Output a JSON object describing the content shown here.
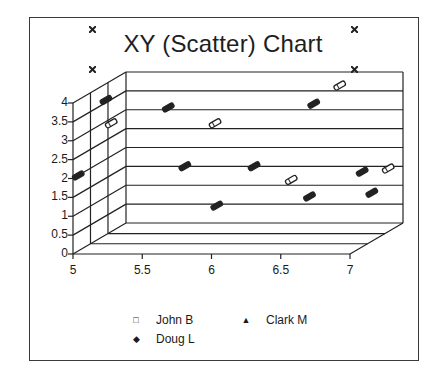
{
  "chart_data": {
    "type": "scatter",
    "title": "XY (Scatter) Chart",
    "xlabel": "",
    "ylabel": "",
    "xlim": [
      5,
      7
    ],
    "ylim": [
      0,
      4
    ],
    "x_ticks": [
      "5",
      "5.5",
      "6",
      "6.5",
      "7"
    ],
    "y_ticks": [
      "0",
      "0.5",
      "1",
      "1.5",
      "2",
      "2.5",
      "3",
      "3.5",
      "4"
    ],
    "grid": true,
    "three_d": true,
    "legend_position": "bottom",
    "series": [
      {
        "name": "John B",
        "marker": "square",
        "points": [
          [
            5.2,
            3.3
          ],
          [
            5.95,
            3.3
          ],
          [
            6.5,
            1.8
          ],
          [
            6.85,
            4.3
          ],
          [
            7.2,
            2.1
          ]
        ]
      },
      {
        "name": "Clark M",
        "marker": "triangle",
        "points": [
          [
            5.75,
            2.2
          ],
          [
            6.25,
            2.2
          ],
          [
            6.65,
            1.4
          ],
          [
            7.1,
            1.5
          ]
        ]
      },
      {
        "name": "Doug L",
        "marker": "diamond",
        "points": [
          [
            5.0,
            2.0
          ],
          [
            5.2,
            4.0
          ],
          [
            5.65,
            3.8
          ],
          [
            6.0,
            1.2
          ],
          [
            6.7,
            3.9
          ],
          [
            7.05,
            2.1
          ]
        ]
      }
    ]
  },
  "title": "XY (Scatter) Chart",
  "legend": [
    {
      "label": "John B",
      "marker": "□"
    },
    {
      "label": "Clark M",
      "marker": "▲"
    },
    {
      "label": "Doug L",
      "marker": "◆"
    }
  ],
  "colors": {
    "frame": "#3a3a3a",
    "grid": "#222222",
    "marker": "#222222",
    "background": "#ffffff"
  }
}
